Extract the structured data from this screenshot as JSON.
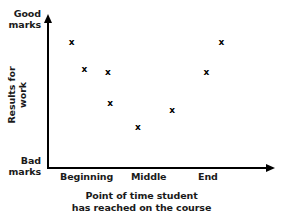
{
  "chart_data": {
    "type": "scatter",
    "title": "",
    "xlabel": "Point of time student has reached on the course",
    "ylabel": "Results for work",
    "grid": false,
    "legend": null,
    "x_tick_labels": [
      "Beginning",
      "Middle",
      "End"
    ],
    "y_axis_low_label": "Bad marks",
    "y_axis_high_label": "Good marks",
    "xlim": [
      0,
      10
    ],
    "ylim": [
      0,
      10
    ],
    "marker": "x",
    "points": [
      {
        "x": 1.1,
        "y": 8.6
      },
      {
        "x": 1.7,
        "y": 6.7
      },
      {
        "x": 2.8,
        "y": 6.5
      },
      {
        "x": 2.9,
        "y": 4.4
      },
      {
        "x": 4.2,
        "y": 2.7
      },
      {
        "x": 5.8,
        "y": 3.9
      },
      {
        "x": 7.4,
        "y": 6.5
      },
      {
        "x": 8.1,
        "y": 8.6
      }
    ]
  },
  "axes": {
    "y_high": {
      "line1": "Good",
      "line2": "marks"
    },
    "y_low": {
      "line1": "Bad",
      "line2": "marks"
    },
    "y_title": {
      "line1": "Results for",
      "line2": "work"
    },
    "x_ticks": [
      {
        "label": "Beginning"
      },
      {
        "label": "Middle"
      },
      {
        "label": "End"
      }
    ],
    "x_caption": {
      "line1": "Point of time student",
      "line2": "has reached on the course"
    }
  },
  "style": {
    "axis_color": "#000000",
    "text_color": "#1a1a1a",
    "marker_color": "#000000",
    "background": "#ffffff"
  }
}
